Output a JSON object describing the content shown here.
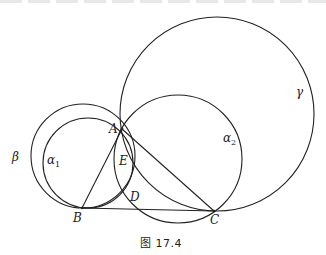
{
  "figure": {
    "caption": "图 17.4",
    "stroke_color": "#222222",
    "background": "#ffffff"
  },
  "points": {
    "A": {
      "label": "A",
      "x": 122,
      "y": 129
    },
    "B": {
      "label": "B",
      "x": 82,
      "y": 208
    },
    "C": {
      "label": "C",
      "x": 214,
      "y": 211
    },
    "D": {
      "label": "D",
      "x": 129,
      "y": 193
    },
    "E": {
      "label": "E",
      "x": 124,
      "y": 160
    }
  },
  "circles": {
    "gamma": {
      "label": "γ",
      "cx": 217,
      "cy": 114,
      "r": 97
    },
    "alpha2": {
      "label": "α",
      "sub": "2",
      "cx": 178,
      "cy": 159,
      "r": 64
    },
    "beta": {
      "label": "β",
      "cx": 83,
      "cy": 156,
      "r": 52
    },
    "alpha1": {
      "label": "α",
      "sub": "1",
      "cx": 88,
      "cy": 163,
      "r": 45
    }
  },
  "segments": [
    {
      "name": "AB",
      "from": "A",
      "to": "B"
    },
    {
      "name": "AC",
      "from": "A",
      "to": "C"
    },
    {
      "name": "BC",
      "from": "B",
      "to": "C"
    }
  ]
}
